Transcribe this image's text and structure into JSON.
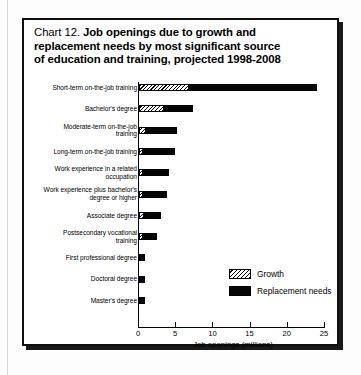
{
  "figure": {
    "label": "Chart 12.",
    "title_line1": "Job openings due to growth and",
    "title_line2": "replacement needs by most significant source",
    "title_line3": "of education and training, projected 1998-2008"
  },
  "legend": {
    "items": [
      {
        "key": "growth",
        "label": "Growth",
        "color": "#ffffff",
        "pattern": "diagonal-hatch"
      },
      {
        "key": "replacement",
        "label": "Replacement needs",
        "color": "#000000",
        "pattern": "solid"
      }
    ]
  },
  "chart_data": {
    "type": "bar",
    "orientation": "horizontal",
    "stacked": true,
    "title": "Chart 12. Job openings due to growth and replacement needs by most significant source of education and training, projected 1998-2008",
    "xlabel": "Job openings (millions)",
    "ylabel": "",
    "xlim": [
      0,
      25
    ],
    "xticks": [
      0,
      5,
      10,
      15,
      20,
      25
    ],
    "xtick_labels": [
      "0",
      "5",
      "10",
      "15",
      "20",
      "25"
    ],
    "grid": false,
    "legend_position": "center-right",
    "categories": [
      "Short-term on-the-job training",
      "Bachelor's degree",
      "Moderate-term on-the-job training",
      "Long-term on-the-job training",
      "Work experience in a related occupation",
      "Work experience plus bachelor's degree or higher",
      "Associate degree",
      "Postsecondary vocational training",
      "First professional degree",
      "Doctoral degree",
      "Master's degree"
    ],
    "category_lines": [
      [
        "Short-term on-the-job training"
      ],
      [
        "Bachelor's degree"
      ],
      [
        "Moderate-term on-the-job",
        "training"
      ],
      [
        "Long-term on-the-job training"
      ],
      [
        "Work experience in a related",
        "occupation"
      ],
      [
        "Work experience plus bachelor's",
        "degree or higher"
      ],
      [
        "Associate degree"
      ],
      [
        "Postsecondary vocational",
        "training"
      ],
      [
        "First professional degree"
      ],
      [
        "Doctoral degree"
      ],
      [
        "Master's degree"
      ]
    ],
    "series": [
      {
        "name": "Growth",
        "values": [
          6.7,
          3.4,
          1.0,
          0.6,
          0.5,
          0.6,
          0.7,
          0.5,
          0.15,
          0.1,
          0.1
        ]
      },
      {
        "name": "Replacement needs",
        "values": [
          17.2,
          3.9,
          4.1,
          4.3,
          3.5,
          3.2,
          2.3,
          1.9,
          0.55,
          0.5,
          0.5
        ]
      }
    ],
    "totals": [
      23.9,
      7.3,
      5.1,
      4.9,
      4.0,
      3.8,
      3.0,
      2.4,
      0.7,
      0.6,
      0.6
    ]
  }
}
